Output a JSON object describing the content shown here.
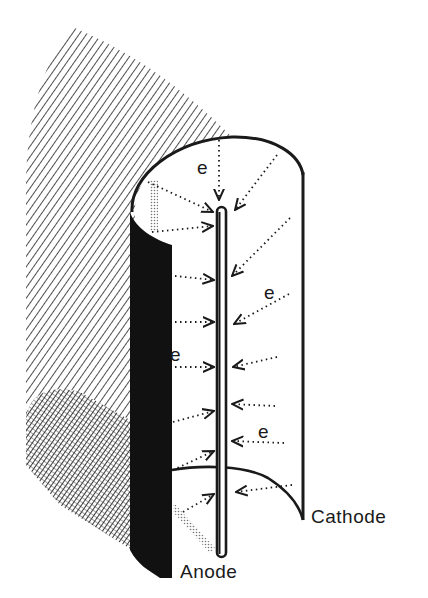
{
  "diagram": {
    "title": "",
    "labels": {
      "cathode": "Cathode",
      "anode": "Anode",
      "electron": "e"
    },
    "electron_labels": [
      {
        "text": "e",
        "x": 197,
        "y": 157
      },
      {
        "text": "e",
        "x": 264,
        "y": 282
      },
      {
        "text": "e",
        "x": 170,
        "y": 344
      },
      {
        "text": "e",
        "x": 258,
        "y": 421
      }
    ],
    "colors": {
      "ink": "#1a1a1a",
      "background": "#ffffff",
      "stipple": "#9a9a9a"
    }
  }
}
